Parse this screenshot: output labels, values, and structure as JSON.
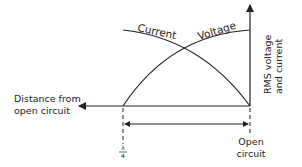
{
  "diagram": {
    "curves": {
      "current_label": "Current",
      "voltage_label": "Voltage"
    },
    "axes": {
      "y_label_line1": "RMS voltage",
      "y_label_line2": "and current",
      "x_label_line1": "Distance from",
      "x_label_line2": "open circuit"
    },
    "markers": {
      "quarter_wave_numerator": "λ",
      "quarter_wave_denominator": "4",
      "open_circuit_line1": "Open",
      "open_circuit_line2": "circuit"
    },
    "colors": {
      "stroke": "#222222",
      "background": "#ffffff"
    }
  }
}
